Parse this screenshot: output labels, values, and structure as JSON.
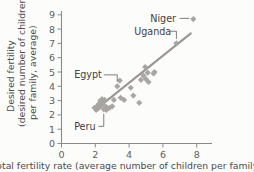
{
  "chart_data": {
    "type": "scatter",
    "title": "",
    "xlabel": "Total fertility rate (average number of children per family)",
    "ylabel": "Desired fertility (desired number of children per family, average)",
    "ylabel_line1": "Desired fertility",
    "ylabel_line2": "(desired number of children",
    "ylabel_line3": "per family, average)",
    "xlim": [
      0,
      8.8
    ],
    "ylim": [
      0,
      9.4
    ],
    "xticks": [
      0,
      2,
      4,
      6,
      8
    ],
    "xtick_labels": [
      "0",
      "2",
      "4",
      "6",
      "8"
    ],
    "yticks": [
      0,
      1,
      2,
      3,
      4,
      5,
      6,
      7,
      8,
      9
    ],
    "ytick_labels": [
      "0",
      "1",
      "2",
      "3",
      "4",
      "5",
      "6",
      "7",
      "8",
      "9"
    ],
    "grid": false,
    "legend": "none",
    "marker_shape": "diamond",
    "marker_color": "#a9a5a3",
    "trendline_color": "#9a9694",
    "axis_color": "#8a8a8a",
    "points": [
      [
        1.95,
        2.5
      ],
      [
        2.05,
        2.35
      ],
      [
        2.1,
        2.6
      ],
      [
        2.15,
        2.45
      ],
      [
        2.2,
        2.75
      ],
      [
        2.25,
        2.55
      ],
      [
        2.3,
        3.0
      ],
      [
        2.35,
        2.7
      ],
      [
        2.4,
        3.1
      ],
      [
        2.45,
        2.9
      ],
      [
        2.5,
        2.4
      ],
      [
        2.55,
        3.05
      ],
      [
        2.6,
        2.6
      ],
      [
        2.65,
        2.35
      ],
      [
        2.7,
        2.45
      ],
      [
        2.85,
        2.5
      ],
      [
        3.0,
        2.6
      ],
      [
        3.1,
        3.05
      ],
      [
        3.3,
        4.0
      ],
      [
        3.45,
        4.4
      ],
      [
        3.5,
        3.2
      ],
      [
        3.7,
        3.05
      ],
      [
        4.1,
        3.9
      ],
      [
        4.25,
        3.35
      ],
      [
        4.6,
        2.85
      ],
      [
        4.7,
        4.45
      ],
      [
        4.85,
        4.75
      ],
      [
        4.95,
        5.35
      ],
      [
        5.0,
        4.5
      ],
      [
        5.1,
        4.95
      ],
      [
        5.15,
        4.3
      ],
      [
        5.45,
        4.9
      ],
      [
        5.5,
        5.0
      ],
      [
        6.8,
        7.0
      ],
      [
        7.8,
        8.7
      ]
    ],
    "trendline": {
      "x0": 2.0,
      "y0": 2.35,
      "x1": 7.65,
      "y1": 7.7
    },
    "annotations": [
      {
        "label": "Niger",
        "point": [
          7.8,
          8.7
        ],
        "label_x": 5.25,
        "label_y": 8.75
      },
      {
        "label": "Uganda",
        "point": [
          6.8,
          7.0
        ],
        "label_x": 4.3,
        "label_y": 7.85
      },
      {
        "label": "Egypt",
        "point": [
          3.3,
          4.0
        ],
        "label_x": 0.75,
        "label_y": 4.8
      },
      {
        "label": "Peru",
        "point": [
          2.5,
          2.4
        ],
        "label_x": 0.75,
        "label_y": 1.2
      }
    ]
  }
}
